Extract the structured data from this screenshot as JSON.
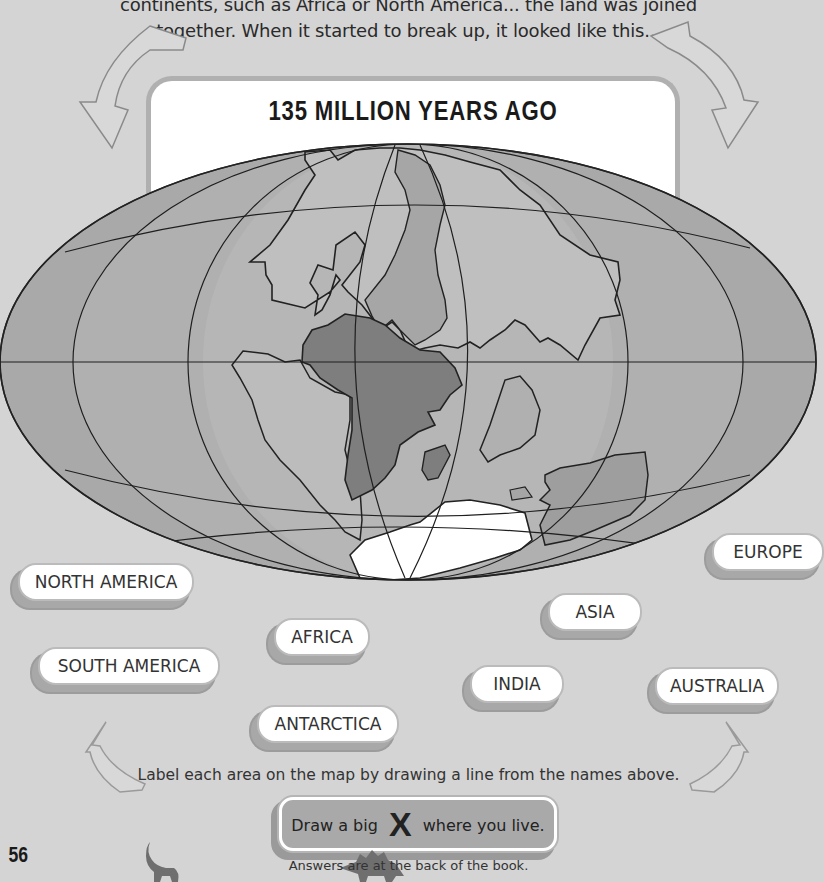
{
  "intro": {
    "line1": "continents, such as Africa or North America... the land was joined",
    "line2": "together. When it started to break up, it looked like this..."
  },
  "title": "135 MILLION YEARS AGO",
  "labels": [
    {
      "id": "north-america",
      "text": "NORTH AMERICA"
    },
    {
      "id": "south-america",
      "text": "SOUTH AMERICA"
    },
    {
      "id": "africa",
      "text": "AFRICA"
    },
    {
      "id": "antarctica",
      "text": "ANTARCTICA"
    },
    {
      "id": "asia",
      "text": "ASIA"
    },
    {
      "id": "india",
      "text": "INDIA"
    },
    {
      "id": "europe",
      "text": "EUROPE"
    },
    {
      "id": "australia",
      "text": "AUSTRALIA"
    }
  ],
  "instruction": "Label each area on the map by drawing a line from the names above.",
  "x_box": {
    "before": "Draw a big",
    "mark": "X",
    "after": "where you live."
  },
  "answers_note": "Answers are at the back of the book.",
  "page_number": "56",
  "colors": {
    "background": "#d4d4d4",
    "ocean": "#a8a8a8",
    "ocean_edge": "#9a9a9a",
    "land_light": "#bdbdbd",
    "africa": "#7e7e7e",
    "antarctica": "#ffffff",
    "grid_line": "#222222"
  }
}
